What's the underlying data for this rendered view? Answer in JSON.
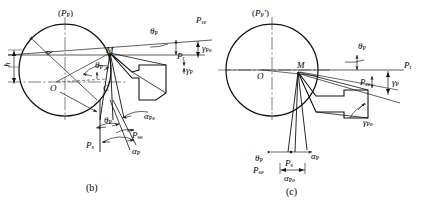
{
  "figure": {
    "type": "engineering-diagram",
    "panels": [
      {
        "id": "b",
        "caption": "(b)",
        "top_plane_label": "(P",
        "top_plane_sub": "P",
        "top_plane_close": ")",
        "labels": {
          "plane_pp": "P",
          "plane_pp_sub": "P",
          "center": "O",
          "point_m": "M",
          "point_c": "C",
          "diameter": "d",
          "height": "h",
          "theta_p_upper": "θ",
          "theta_p_upper_sub": "P",
          "theta_p_mid": "θ",
          "theta_p_mid_sub": "P",
          "theta_p_lower": "θ",
          "theta_p_lower_sub": "P",
          "p_re": "P",
          "p_re_sub": "re",
          "p_r": "P",
          "p_r_sub": "r",
          "gamma_pe": "γ",
          "gamma_pe_sub": "Pe",
          "gamma_p": "γ",
          "gamma_p_sub": "P",
          "alpha_pe": "α",
          "alpha_pe_sub": "Pe",
          "alpha_p": "α",
          "alpha_p_sub": "P",
          "p_se": "P",
          "p_se_sub": "se",
          "p_s": "P",
          "p_s_sub": "s"
        }
      },
      {
        "id": "c",
        "caption": "(c)",
        "top_plane_label": "(P",
        "top_plane_sub": "P",
        "top_plane_prime": "′",
        "top_plane_close": ")",
        "labels": {
          "center": "O",
          "point_m": "M",
          "theta_p_right": "θ",
          "theta_p_right_sub": "P",
          "theta_p_bottom": "θ",
          "theta_p_bottom_sub": "P",
          "p_r": "P",
          "p_r_sub": "r",
          "p_re": "P",
          "p_re_sub": "re",
          "gamma_p": "γ",
          "gamma_p_sub": "P",
          "gamma_pe": "γ",
          "gamma_pe_sub": "Pe",
          "alpha_p": "α",
          "alpha_p_sub": "P",
          "alpha_pe": "α",
          "alpha_pe_sub": "Pe",
          "p_s": "P",
          "p_s_sub": "s",
          "p_se": "P",
          "p_se_sub": "se"
        }
      }
    ],
    "colors": {
      "line": "#1a1a1a",
      "centerline": "#555555",
      "background": "#ffffff"
    }
  }
}
